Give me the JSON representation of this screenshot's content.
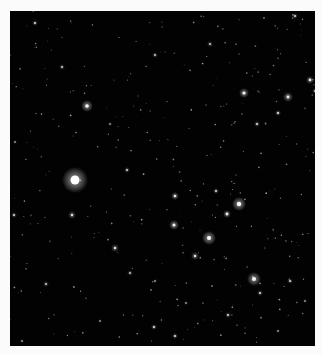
{
  "image": {
    "subject": "Star field",
    "frame": {
      "x": 10,
      "y": 11,
      "width": 305,
      "height": 335,
      "background": "#020202",
      "border_color": "#fbfbfb"
    },
    "stars": [
      {
        "x": 65,
        "y": 169,
        "r": 4.5,
        "glow": 13,
        "b": 1.0
      },
      {
        "x": 77,
        "y": 95,
        "r": 1.8,
        "glow": 6,
        "b": 0.85
      },
      {
        "x": 229,
        "y": 193,
        "r": 2.2,
        "glow": 7,
        "b": 0.9
      },
      {
        "x": 199,
        "y": 227,
        "r": 2.0,
        "glow": 7,
        "b": 0.9
      },
      {
        "x": 244,
        "y": 268,
        "r": 2.0,
        "glow": 7,
        "b": 0.85
      },
      {
        "x": 234,
        "y": 82,
        "r": 1.6,
        "glow": 5,
        "b": 0.8
      },
      {
        "x": 278,
        "y": 86,
        "r": 1.4,
        "glow": 5,
        "b": 0.75
      },
      {
        "x": 300,
        "y": 69,
        "r": 1.3,
        "glow": 4,
        "b": 0.7
      },
      {
        "x": 217,
        "y": 203,
        "r": 1.4,
        "glow": 4,
        "b": 0.75
      },
      {
        "x": 164,
        "y": 214,
        "r": 1.5,
        "glow": 5,
        "b": 0.8
      },
      {
        "x": 165,
        "y": 185,
        "r": 1.3,
        "glow": 4,
        "b": 0.7
      },
      {
        "x": 185,
        "y": 245,
        "r": 1.2,
        "glow": 4,
        "b": 0.65
      },
      {
        "x": 268,
        "y": 102,
        "r": 1.1,
        "glow": 3,
        "b": 0.6
      },
      {
        "x": 247,
        "y": 113,
        "r": 1.0,
        "glow": 3,
        "b": 0.55
      },
      {
        "x": 206,
        "y": 180,
        "r": 1.0,
        "glow": 3,
        "b": 0.55
      },
      {
        "x": 105,
        "y": 237,
        "r": 1.2,
        "glow": 4,
        "b": 0.6
      },
      {
        "x": 62,
        "y": 204,
        "r": 1.2,
        "glow": 4,
        "b": 0.6
      },
      {
        "x": 4,
        "y": 204,
        "r": 1.0,
        "glow": 3,
        "b": 0.5
      },
      {
        "x": 117,
        "y": 159,
        "r": 1.0,
        "glow": 3,
        "b": 0.5
      },
      {
        "x": 144,
        "y": 316,
        "r": 1.1,
        "glow": 3,
        "b": 0.55
      },
      {
        "x": 165,
        "y": 325,
        "r": 1.0,
        "glow": 3,
        "b": 0.55
      },
      {
        "x": 218,
        "y": 304,
        "r": 1.0,
        "glow": 3,
        "b": 0.5
      },
      {
        "x": 250,
        "y": 282,
        "r": 1.0,
        "glow": 3,
        "b": 0.5
      },
      {
        "x": 280,
        "y": 270,
        "r": 1.0,
        "glow": 3,
        "b": 0.45
      },
      {
        "x": 305,
        "y": 80,
        "r": 0.9,
        "glow": 3,
        "b": 0.45
      },
      {
        "x": 25,
        "y": 12,
        "r": 1.0,
        "glow": 3,
        "b": 0.5
      },
      {
        "x": 200,
        "y": 33,
        "r": 0.9,
        "glow": 3,
        "b": 0.45
      },
      {
        "x": 285,
        "y": 5,
        "r": 1.0,
        "glow": 3,
        "b": 0.5
      },
      {
        "x": 145,
        "y": 44,
        "r": 0.9,
        "glow": 3,
        "b": 0.45
      },
      {
        "x": 52,
        "y": 56,
        "r": 0.9,
        "glow": 3,
        "b": 0.45
      },
      {
        "x": 100,
        "y": 113,
        "r": 0.8,
        "glow": 2,
        "b": 0.4
      },
      {
        "x": 36,
        "y": 273,
        "r": 0.9,
        "glow": 3,
        "b": 0.45
      },
      {
        "x": 120,
        "y": 262,
        "r": 0.9,
        "glow": 3,
        "b": 0.4
      },
      {
        "x": 5,
        "y": 131,
        "r": 0.8,
        "glow": 2,
        "b": 0.4
      },
      {
        "x": 145,
        "y": 270,
        "r": 0.8,
        "glow": 2,
        "b": 0.4
      },
      {
        "x": 176,
        "y": 292,
        "r": 0.8,
        "glow": 2,
        "b": 0.4
      },
      {
        "x": 268,
        "y": 320,
        "r": 0.8,
        "glow": 2,
        "b": 0.4
      },
      {
        "x": 295,
        "y": 290,
        "r": 0.8,
        "glow": 2,
        "b": 0.4
      },
      {
        "x": 12,
        "y": 330,
        "r": 0.8,
        "glow": 2,
        "b": 0.4
      },
      {
        "x": 90,
        "y": 310,
        "r": 0.8,
        "glow": 2,
        "b": 0.35
      }
    ],
    "faint_star_count": 320,
    "faint_seed": 7
  }
}
